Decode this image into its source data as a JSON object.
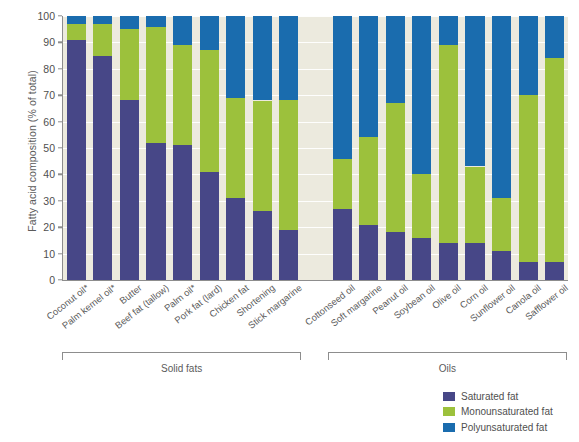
{
  "chart_data": {
    "type": "bar",
    "subtype": "stacked-bar-100",
    "title": "",
    "xlabel": "",
    "ylabel": "Fatty acid composition (% of total)",
    "ylim": [
      0,
      100
    ],
    "ytick_values": [
      0,
      10,
      20,
      30,
      40,
      50,
      60,
      70,
      80,
      90,
      100
    ],
    "ytick_labels": [
      "0",
      "10",
      "20",
      "30",
      "40",
      "50",
      "60",
      "70",
      "80",
      "90",
      "100"
    ],
    "grid": true,
    "legend_position": "bottom-right",
    "categories": [
      "Coconut oil*",
      "Palm kernel oil*",
      "Butter",
      "Beef fat (tallow)",
      "Palm oil*",
      "Pork fat (lard)",
      "Chicken fat",
      "Shortening",
      "Stick margarine",
      "Cottonseed oil",
      "Soft margarine",
      "Peanut oil",
      "Soybean oil",
      "Olive oil",
      "Corn oil",
      "Sunflower oil",
      "Canola oil",
      "Safflower oil"
    ],
    "series": [
      {
        "name": "Saturated fat",
        "color": "#474787",
        "values": [
          91,
          85,
          68,
          52,
          51,
          41,
          31,
          26,
          19,
          27,
          21,
          18,
          16,
          14,
          14,
          11,
          7,
          7
        ]
      },
      {
        "name": "Monounsaturated fat",
        "color": "#9cc13c",
        "values": [
          6,
          12,
          27,
          44,
          38,
          46,
          38,
          42,
          49,
          19,
          33,
          49,
          24,
          75,
          29,
          20,
          63,
          77
        ]
      },
      {
        "name": "Polyunsaturated fat",
        "color": "#1a6cae",
        "values": [
          3,
          3,
          5,
          4,
          11,
          13,
          31,
          32,
          32,
          54,
          46,
          33,
          60,
          11,
          57,
          69,
          30,
          16
        ]
      }
    ],
    "cumulative_tops": {
      "saturated": [
        91,
        85,
        68,
        52,
        51,
        41,
        31,
        26,
        19,
        27,
        21,
        18,
        16,
        14,
        14,
        11,
        7,
        7
      ],
      "saturated_plus_mono": [
        97,
        97,
        95,
        96,
        89,
        87,
        69,
        68,
        68,
        46,
        54,
        67,
        40,
        89,
        43,
        31,
        70,
        84
      ]
    },
    "groups": [
      {
        "label": "Solid fats",
        "start_index": 0,
        "end_index": 8
      },
      {
        "label": "Oils",
        "start_index": 9,
        "end_index": 17
      }
    ],
    "gap_after_index": 8
  },
  "legend": {
    "items": [
      {
        "label": "Saturated fat",
        "color": "#474787",
        "swatch_name": "legend-swatch-saturated"
      },
      {
        "label": "Monounsaturated fat",
        "color": "#9cc13c",
        "swatch_name": "legend-swatch-monounsaturated"
      },
      {
        "label": "Polyunsaturated fat",
        "color": "#1a6cae",
        "swatch_name": "legend-swatch-polyunsaturated"
      }
    ]
  },
  "style": {
    "plot_background": "#eceade",
    "gridline_color": "#ffffff",
    "axis_color": "#8d8d8d",
    "text_color": "#5b5b5b",
    "page_background": "#ffffff"
  }
}
